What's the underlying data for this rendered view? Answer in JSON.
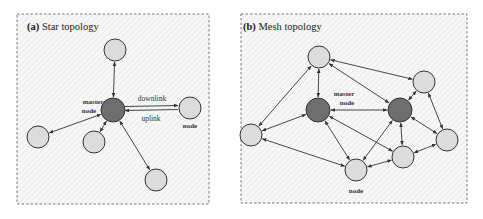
{
  "panels": [
    {
      "id": "star",
      "label_prefix": "(a)",
      "label_text": " Star topology",
      "box": {
        "x": 17,
        "y": 14,
        "w": 192,
        "h": 190
      },
      "nodes": [
        {
          "id": "master",
          "x": 113,
          "y": 110,
          "r": 12,
          "type": "master"
        },
        {
          "id": "n_top",
          "x": 115,
          "y": 50,
          "r": 11,
          "type": "node"
        },
        {
          "id": "n_right",
          "x": 190,
          "y": 108,
          "r": 11,
          "type": "node"
        },
        {
          "id": "n_left",
          "x": 38,
          "y": 137,
          "r": 11,
          "type": "node"
        },
        {
          "id": "n_small",
          "x": 94,
          "y": 142,
          "r": 11,
          "type": "node"
        },
        {
          "id": "n_bottom",
          "x": 156,
          "y": 180,
          "r": 11,
          "type": "node"
        }
      ],
      "edges": [
        [
          "master",
          "n_top"
        ],
        [
          "master",
          "n_left"
        ],
        [
          "master",
          "n_small"
        ],
        [
          "master",
          "n_bottom"
        ]
      ],
      "texts": {
        "master_label_1": "master",
        "master_label_2": "node",
        "downlink": "downlink",
        "uplink": "uplink",
        "node_label": "node"
      }
    },
    {
      "id": "mesh",
      "label_prefix": "(b)",
      "label_text": " Mesh topology",
      "box": {
        "x": 241,
        "y": 14,
        "w": 226,
        "h": 189
      },
      "nodes": [
        {
          "id": "m1",
          "x": 318,
          "y": 110,
          "r": 12,
          "type": "master"
        },
        {
          "id": "m2",
          "x": 400,
          "y": 110,
          "r": 12,
          "type": "master"
        },
        {
          "id": "top",
          "x": 319,
          "y": 57,
          "r": 11,
          "type": "node"
        },
        {
          "id": "ur",
          "x": 424,
          "y": 82,
          "r": 11,
          "type": "node"
        },
        {
          "id": "left",
          "x": 251,
          "y": 135,
          "r": 11,
          "type": "node"
        },
        {
          "id": "right",
          "x": 447,
          "y": 140,
          "r": 11,
          "type": "node"
        },
        {
          "id": "mr",
          "x": 403,
          "y": 157,
          "r": 11,
          "type": "node"
        },
        {
          "id": "bottom",
          "x": 356,
          "y": 170,
          "r": 11,
          "type": "node"
        }
      ],
      "edges": [
        [
          "top",
          "m1"
        ],
        [
          "top",
          "left"
        ],
        [
          "top",
          "ur"
        ],
        [
          "top",
          "m2"
        ],
        [
          "m1",
          "m2"
        ],
        [
          "m1",
          "left"
        ],
        [
          "m1",
          "bottom"
        ],
        [
          "m1",
          "mr"
        ],
        [
          "left",
          "bottom"
        ],
        [
          "m2",
          "ur"
        ],
        [
          "m2",
          "bottom"
        ],
        [
          "m2",
          "mr"
        ],
        [
          "m2",
          "right"
        ],
        [
          "ur",
          "right"
        ],
        [
          "right",
          "mr"
        ],
        [
          "mr",
          "bottom"
        ]
      ],
      "texts": {
        "master_label_1": "master",
        "master_label_2": "node",
        "node_label": "node"
      }
    }
  ],
  "colors": {
    "master_fill": "#6e6e6e",
    "node_fill": "#dcdcdc",
    "stroke": "#333333",
    "edge": "#333333",
    "box_border": "#555555",
    "hatch": "#e4e4e4"
  }
}
